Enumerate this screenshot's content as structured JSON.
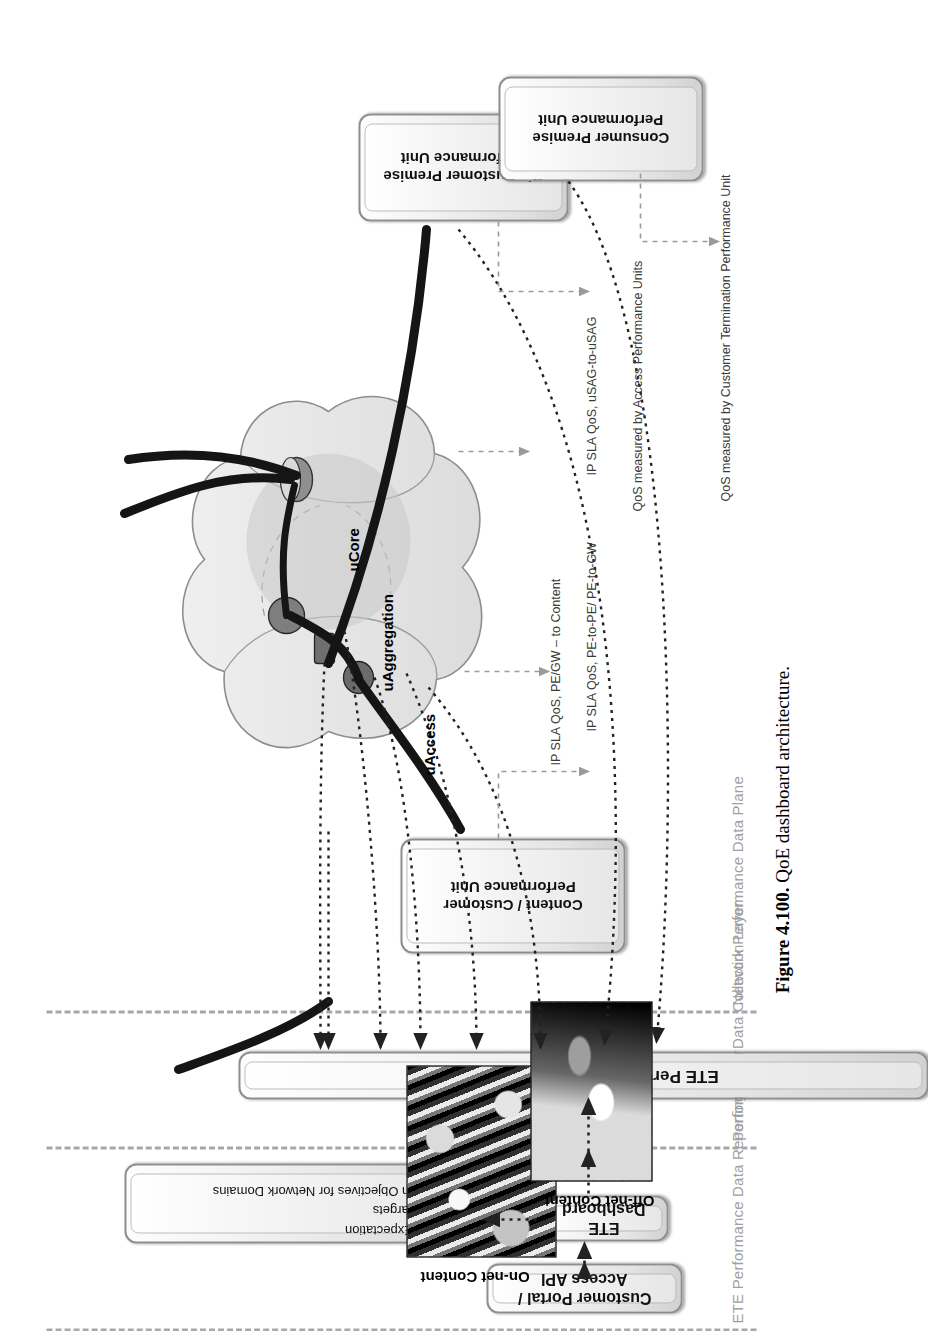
{
  "figure": {
    "number": "Figure 4.100.",
    "caption": "QoE dashboard architecture."
  },
  "layers": [
    {
      "id": "reporting",
      "label": "ETE Performance Data Reporting Layer"
    },
    {
      "id": "collection",
      "label": "Performance Data Collection Layer"
    },
    {
      "id": "dataplane",
      "label": "Network Performance Data Plane"
    }
  ],
  "boxes": {
    "customer_portal": "Customer Portal / Access API",
    "ete_dashboard": "ETE Dashboard",
    "ete_collection": "ETE Performance Data Collection",
    "objectives_title": "",
    "content_customer_pu": "Content / Customer\nPerformance Unit",
    "biz_premise_pu": "Biz Customer Premise\nPerformance Unit",
    "consumer_premise_pu": "Consumer Premise\nPerformance Unit"
  },
  "objectives": [
    "QoE Expectation",
    "SLA Targets",
    "Design Objectives for Network Domains"
  ],
  "content": [
    {
      "label": "On-net Content"
    },
    {
      "label": "Off-net Content"
    }
  ],
  "network_domains": [
    {
      "label": "uCore"
    },
    {
      "label": "uAggregation"
    },
    {
      "label": "uAccess"
    }
  ],
  "annotations": [
    "IP SLA  QoS, PE/GW – to Content",
    "IP SLA  QoS, PE-to-PE/ PE-to-GW",
    "IP SLA  QoS, uSAG-to-uSAG",
    "QoS measured by Access Performance Units",
    "QoS measured by Customer Termination Performance Unit"
  ],
  "colors": {
    "layer_divider": "#a8a8a8",
    "layer_label": "#a0a0a0",
    "box_border": "#8e8e8e",
    "annotation": "#3a3a3a",
    "annotation_gray": "#6f6f6f",
    "link_solid": "#1a1a1a",
    "link_dotted": "#222222"
  }
}
